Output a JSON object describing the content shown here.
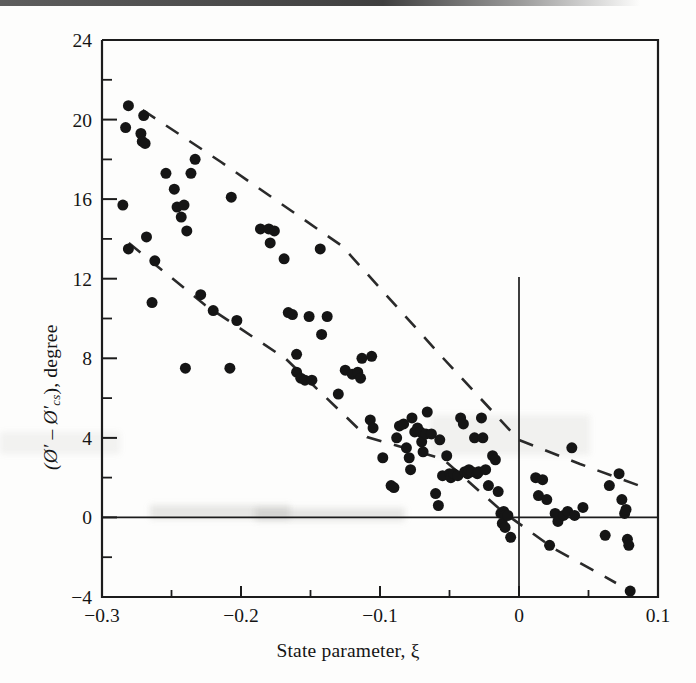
{
  "figure": {
    "kind": "scatter-plot",
    "background_color": "#fdfdfc",
    "ink_color": "#151515",
    "scan_artifact": true
  },
  "axes": {
    "x_title": "State parameter, ξ",
    "y_title_prefix": "(Ø′ – Ø′",
    "y_title_subscript": "cs",
    "y_title_suffix": "), degree",
    "x_ticks": [
      "-0.3",
      "-0.2",
      "-0.1",
      "0",
      "0.1"
    ],
    "y_ticks": [
      "24",
      "20",
      "16",
      "12",
      "8",
      "4",
      "0",
      "-4"
    ],
    "x_tick_display": [
      "−0.3",
      "−0.2",
      "−0.1",
      "0",
      "0.1"
    ],
    "y_tick_display": [
      "24",
      "20",
      "16",
      "12",
      "8",
      "4",
      "0",
      "−4"
    ],
    "zero_glyph_note": "0"
  },
  "chart_data": {
    "type": "scatter",
    "title": "",
    "xlabel": "State parameter, ξ",
    "ylabel": "(Ø' - Ø'cs), degree",
    "xlim": [
      -0.3,
      0.1
    ],
    "ylim": [
      -4,
      24
    ],
    "xticks": [
      -0.3,
      -0.2,
      -0.1,
      0,
      0.1
    ],
    "yticks": [
      24,
      20,
      16,
      12,
      8,
      4,
      0,
      -4
    ],
    "x_minor_tick_step": 0.05,
    "y_minor_tick_step": 2,
    "grid": false,
    "legend": null,
    "marker": "filled-circle",
    "marker_size_px": 11,
    "reference_lines": [
      {
        "name": "y-zero-horizontal",
        "type": "horizontal",
        "value": 0,
        "style": "solid"
      },
      {
        "name": "x-zero-vertical",
        "type": "vertical",
        "value": 0,
        "style": "solid",
        "y_from": -4,
        "y_to": 12.3
      }
    ],
    "trend_bands": [
      {
        "name": "upper-bound-dashed",
        "style": "dashed",
        "points": [
          [
            -0.271,
            20.6
          ],
          [
            -0.086,
            8.1
          ],
          [
            0.0,
            3.9
          ],
          [
            0.087,
            1.5
          ]
        ]
      },
      {
        "name": "lower-bound-dashed",
        "style": "dashed",
        "points": [
          [
            -0.281,
            13.8
          ],
          [
            -0.168,
            7.9
          ],
          [
            -0.083,
            2.9
          ],
          [
            -0.012,
            -0.3
          ],
          [
            0.082,
            -3.3
          ]
        ]
      }
    ],
    "series": [
      {
        "name": "sand test data",
        "points": [
          [
            -0.281,
            20.7
          ],
          [
            -0.283,
            19.6
          ],
          [
            -0.27,
            20.2
          ],
          [
            -0.272,
            19.3
          ],
          [
            -0.271,
            18.9
          ],
          [
            -0.269,
            18.8
          ],
          [
            -0.285,
            15.7
          ],
          [
            -0.281,
            13.5
          ],
          [
            -0.268,
            14.1
          ],
          [
            -0.262,
            12.9
          ],
          [
            -0.264,
            10.8
          ],
          [
            -0.254,
            17.3
          ],
          [
            -0.248,
            16.5
          ],
          [
            -0.246,
            15.6
          ],
          [
            -0.241,
            15.7
          ],
          [
            -0.243,
            15.1
          ],
          [
            -0.239,
            14.4
          ],
          [
            -0.24,
            7.5
          ],
          [
            -0.233,
            18.0
          ],
          [
            -0.229,
            11.2
          ],
          [
            -0.236,
            17.3
          ],
          [
            -0.22,
            10.4
          ],
          [
            -0.207,
            16.1
          ],
          [
            -0.208,
            7.5
          ],
          [
            -0.203,
            9.9
          ],
          [
            -0.186,
            14.5
          ],
          [
            -0.18,
            14.5
          ],
          [
            -0.179,
            13.8
          ],
          [
            -0.176,
            14.4
          ],
          [
            -0.169,
            13.0
          ],
          [
            -0.166,
            10.3
          ],
          [
            -0.163,
            10.2
          ],
          [
            -0.16,
            8.2
          ],
          [
            -0.16,
            7.3
          ],
          [
            -0.157,
            7.0
          ],
          [
            -0.154,
            6.9
          ],
          [
            -0.151,
            10.1
          ],
          [
            -0.149,
            6.9
          ],
          [
            -0.143,
            13.5
          ],
          [
            -0.142,
            9.2
          ],
          [
            -0.138,
            10.1
          ],
          [
            -0.13,
            6.2
          ],
          [
            -0.125,
            7.4
          ],
          [
            -0.12,
            7.2
          ],
          [
            -0.116,
            7.3
          ],
          [
            -0.114,
            7.0
          ],
          [
            -0.113,
            8.0
          ],
          [
            -0.106,
            8.1
          ],
          [
            -0.107,
            4.9
          ],
          [
            -0.105,
            4.5
          ],
          [
            -0.098,
            3.0
          ],
          [
            -0.092,
            1.6
          ],
          [
            -0.09,
            1.5
          ],
          [
            -0.088,
            4.0
          ],
          [
            -0.086,
            4.6
          ],
          [
            -0.083,
            4.7
          ],
          [
            -0.081,
            3.5
          ],
          [
            -0.079,
            3.0
          ],
          [
            -0.078,
            2.4
          ],
          [
            -0.077,
            5.0
          ],
          [
            -0.075,
            4.3
          ],
          [
            -0.073,
            4.5
          ],
          [
            -0.071,
            4.3
          ],
          [
            -0.07,
            3.8
          ],
          [
            -0.069,
            3.3
          ],
          [
            -0.067,
            4.2
          ],
          [
            -0.066,
            5.3
          ],
          [
            -0.063,
            4.2
          ],
          [
            -0.06,
            1.2
          ],
          [
            -0.058,
            0.6
          ],
          [
            -0.057,
            3.9
          ],
          [
            -0.055,
            2.1
          ],
          [
            -0.052,
            3.1
          ],
          [
            -0.05,
            2.2
          ],
          [
            -0.049,
            2.0
          ],
          [
            -0.047,
            2.2
          ],
          [
            -0.044,
            2.1
          ],
          [
            -0.042,
            5.0
          ],
          [
            -0.04,
            4.7
          ],
          [
            -0.039,
            2.3
          ],
          [
            -0.037,
            2.2
          ],
          [
            -0.036,
            2.4
          ],
          [
            -0.034,
            2.3
          ],
          [
            -0.032,
            4.0
          ],
          [
            -0.03,
            2.2
          ],
          [
            -0.029,
            2.3
          ],
          [
            -0.027,
            5.0
          ],
          [
            -0.026,
            4.0
          ],
          [
            -0.024,
            2.4
          ],
          [
            -0.022,
            1.6
          ],
          [
            -0.019,
            3.1
          ],
          [
            -0.017,
            2.9
          ],
          [
            -0.015,
            1.3
          ],
          [
            -0.013,
            0.2
          ],
          [
            -0.012,
            -0.3
          ],
          [
            -0.011,
            0.3
          ],
          [
            -0.01,
            0.1
          ],
          [
            -0.01,
            -0.5
          ],
          [
            -0.008,
            0.1
          ],
          [
            -0.006,
            -1.0
          ],
          [
            0.012,
            2.0
          ],
          [
            0.014,
            1.1
          ],
          [
            0.017,
            1.9
          ],
          [
            0.02,
            0.9
          ],
          [
            0.022,
            -1.4
          ],
          [
            0.026,
            0.2
          ],
          [
            0.028,
            -0.2
          ],
          [
            0.032,
            0.1
          ],
          [
            0.035,
            0.3
          ],
          [
            0.038,
            3.5
          ],
          [
            0.04,
            0.1
          ],
          [
            0.046,
            0.5
          ],
          [
            0.062,
            -0.9
          ],
          [
            0.065,
            1.6
          ],
          [
            0.072,
            2.2
          ],
          [
            0.074,
            0.9
          ],
          [
            0.076,
            0.2
          ],
          [
            0.077,
            0.4
          ],
          [
            0.078,
            -1.1
          ],
          [
            0.079,
            -1.4
          ],
          [
            0.08,
            -3.7
          ]
        ]
      }
    ]
  }
}
